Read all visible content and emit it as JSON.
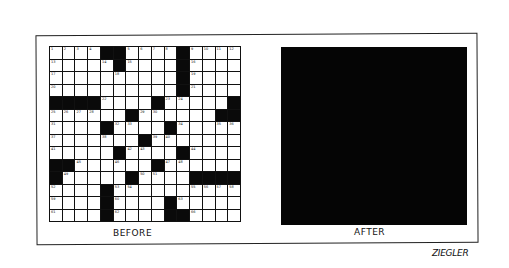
{
  "cartoon": {
    "panels": [
      {
        "label": "BEFORE",
        "content": "crossword-grid"
      },
      {
        "label": "AFTER",
        "content": "solid-black-square"
      }
    ],
    "signature": "ZIEGLER"
  },
  "grid": {
    "columns": 15,
    "rows": 14,
    "black_cells": [
      [
        0,
        4
      ],
      [
        0,
        5
      ],
      [
        0,
        10
      ],
      [
        1,
        5
      ],
      [
        1,
        10
      ],
      [
        2,
        10
      ],
      [
        3,
        10
      ],
      [
        4,
        0
      ],
      [
        4,
        1
      ],
      [
        4,
        2
      ],
      [
        4,
        3
      ],
      [
        4,
        8
      ],
      [
        4,
        14
      ],
      [
        5,
        6
      ],
      [
        5,
        13
      ],
      [
        5,
        14
      ],
      [
        6,
        4
      ],
      [
        6,
        9
      ],
      [
        7,
        7
      ],
      [
        8,
        5
      ],
      [
        8,
        10
      ],
      [
        9,
        0
      ],
      [
        9,
        1
      ],
      [
        9,
        8
      ],
      [
        10,
        0
      ],
      [
        10,
        6
      ],
      [
        10,
        11
      ],
      [
        10,
        12
      ],
      [
        10,
        13
      ],
      [
        10,
        14
      ],
      [
        11,
        4
      ],
      [
        12,
        4
      ],
      [
        12,
        9
      ],
      [
        13,
        4
      ],
      [
        13,
        9
      ],
      [
        13,
        10
      ]
    ],
    "numbers": [
      {
        "r": 0,
        "c": 0,
        "n": "1"
      },
      {
        "r": 0,
        "c": 1,
        "n": "2"
      },
      {
        "r": 0,
        "c": 2,
        "n": "3"
      },
      {
        "r": 0,
        "c": 3,
        "n": "4"
      },
      {
        "r": 0,
        "c": 6,
        "n": "5"
      },
      {
        "r": 0,
        "c": 7,
        "n": "6"
      },
      {
        "r": 0,
        "c": 8,
        "n": "7"
      },
      {
        "r": 0,
        "c": 9,
        "n": "8"
      },
      {
        "r": 0,
        "c": 11,
        "n": "9"
      },
      {
        "r": 0,
        "c": 12,
        "n": "10"
      },
      {
        "r": 0,
        "c": 13,
        "n": "11"
      },
      {
        "r": 0,
        "c": 14,
        "n": "12"
      },
      {
        "r": 1,
        "c": 0,
        "n": "13"
      },
      {
        "r": 1,
        "c": 4,
        "n": "14"
      },
      {
        "r": 1,
        "c": 6,
        "n": "15"
      },
      {
        "r": 1,
        "c": 11,
        "n": "16"
      },
      {
        "r": 2,
        "c": 0,
        "n": "17"
      },
      {
        "r": 2,
        "c": 5,
        "n": "18"
      },
      {
        "r": 2,
        "c": 11,
        "n": "19"
      },
      {
        "r": 3,
        "c": 0,
        "n": "20"
      },
      {
        "r": 3,
        "c": 11,
        "n": "21"
      },
      {
        "r": 4,
        "c": 4,
        "n": "22"
      },
      {
        "r": 4,
        "c": 9,
        "n": "23"
      },
      {
        "r": 4,
        "c": 10,
        "n": "24"
      },
      {
        "r": 5,
        "c": 0,
        "n": "25"
      },
      {
        "r": 5,
        "c": 1,
        "n": "26"
      },
      {
        "r": 5,
        "c": 2,
        "n": "27"
      },
      {
        "r": 5,
        "c": 3,
        "n": "28"
      },
      {
        "r": 5,
        "c": 7,
        "n": "29"
      },
      {
        "r": 5,
        "c": 8,
        "n": "30"
      },
      {
        "r": 6,
        "c": 0,
        "n": "31"
      },
      {
        "r": 6,
        "c": 5,
        "n": "32"
      },
      {
        "r": 6,
        "c": 6,
        "n": "33"
      },
      {
        "r": 6,
        "c": 10,
        "n": "34"
      },
      {
        "r": 6,
        "c": 13,
        "n": "35"
      },
      {
        "r": 6,
        "c": 14,
        "n": "36"
      },
      {
        "r": 7,
        "c": 0,
        "n": "37"
      },
      {
        "r": 7,
        "c": 4,
        "n": "38"
      },
      {
        "r": 7,
        "c": 8,
        "n": "39"
      },
      {
        "r": 7,
        "c": 9,
        "n": "40"
      },
      {
        "r": 8,
        "c": 0,
        "n": "41"
      },
      {
        "r": 8,
        "c": 6,
        "n": "42"
      },
      {
        "r": 8,
        "c": 7,
        "n": "43"
      },
      {
        "r": 8,
        "c": 11,
        "n": "44"
      },
      {
        "r": 9,
        "c": 2,
        "n": "45"
      },
      {
        "r": 9,
        "c": 5,
        "n": "46"
      },
      {
        "r": 9,
        "c": 9,
        "n": "47"
      },
      {
        "r": 9,
        "c": 10,
        "n": "48"
      },
      {
        "r": 10,
        "c": 1,
        "n": "49"
      },
      {
        "r": 10,
        "c": 7,
        "n": "50"
      },
      {
        "r": 10,
        "c": 8,
        "n": "51"
      },
      {
        "r": 11,
        "c": 0,
        "n": "52"
      },
      {
        "r": 11,
        "c": 5,
        "n": "53"
      },
      {
        "r": 11,
        "c": 6,
        "n": "54"
      },
      {
        "r": 11,
        "c": 11,
        "n": "55"
      },
      {
        "r": 11,
        "c": 12,
        "n": "56"
      },
      {
        "r": 11,
        "c": 13,
        "n": "57"
      },
      {
        "r": 11,
        "c": 14,
        "n": "58"
      },
      {
        "r": 12,
        "c": 0,
        "n": "59"
      },
      {
        "r": 12,
        "c": 5,
        "n": "60"
      },
      {
        "r": 13,
        "c": 0,
        "n": "61"
      },
      {
        "r": 13,
        "c": 5,
        "n": "62"
      },
      {
        "r": 12,
        "c": 10,
        "n": "63"
      },
      {
        "r": 13,
        "c": 0,
        "n": "64"
      },
      {
        "r": 13,
        "c": 5,
        "n": "65"
      },
      {
        "r": 13,
        "c": 11,
        "n": "66"
      }
    ]
  },
  "colors": {
    "ink": "#0a0a0a",
    "paper": "#ffffff"
  }
}
